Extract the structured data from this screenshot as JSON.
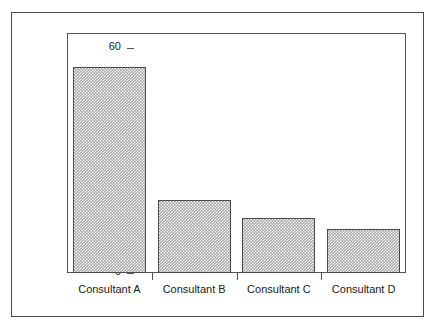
{
  "chart_data": {
    "type": "bar",
    "title": "",
    "subtitle": "",
    "xlabel": "",
    "ylabel": "Percentage of cases",
    "categories": [
      "Consultant A",
      "Consultant B",
      "Consultant C",
      "Consultant D"
    ],
    "values": [
      55,
      19.5,
      14.7,
      11.7
    ],
    "ylim": [
      0,
      64
    ],
    "yticks": [
      0,
      10,
      20,
      30,
      40,
      50,
      60
    ],
    "ytick_labels": [
      "0",
      "10",
      "20",
      "30",
      "40",
      "50",
      "60"
    ],
    "grid": false,
    "legend": null,
    "legend_position": "none",
    "bar_fill": "#a8a8a8",
    "bar_edge": "#4a4a4a",
    "axis_color": "#555555",
    "frame_color": "#4a4a4a",
    "background": "#ffffff",
    "annotations": []
  },
  "figure": {
    "outer_frame_label": "figure-border"
  }
}
